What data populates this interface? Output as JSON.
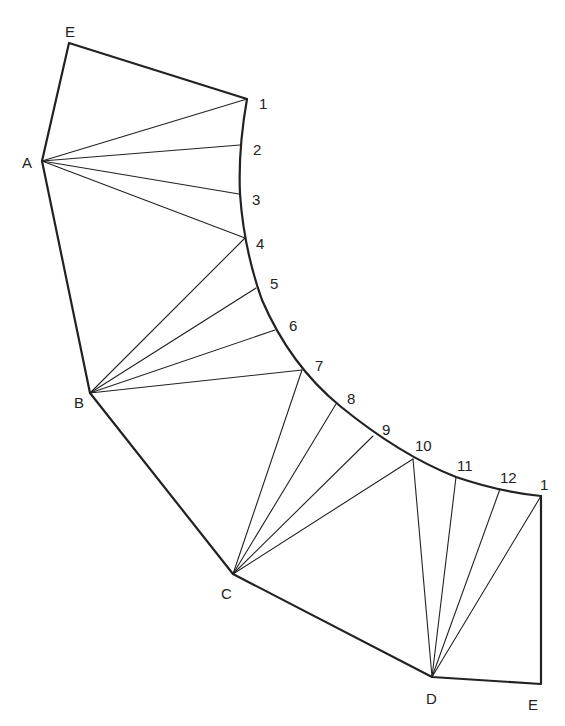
{
  "diagram": {
    "points": {
      "E_top": {
        "x": 69,
        "y": 43
      },
      "A": {
        "x": 42,
        "y": 161
      },
      "B": {
        "x": 90,
        "y": 393
      },
      "C": {
        "x": 233,
        "y": 574
      },
      "D": {
        "x": 432,
        "y": 677
      },
      "E_bottom": {
        "x": 541,
        "y": 684
      },
      "p1_top": {
        "x": 247,
        "y": 99
      },
      "p2": {
        "x": 240,
        "y": 145
      },
      "p3": {
        "x": 239,
        "y": 194
      },
      "p4": {
        "x": 245,
        "y": 238
      },
      "p5": {
        "x": 256,
        "y": 288
      },
      "p6": {
        "x": 275,
        "y": 330
      },
      "p7": {
        "x": 302,
        "y": 370
      },
      "p8": {
        "x": 336,
        "y": 404
      },
      "p9": {
        "x": 373,
        "y": 436
      },
      "p10": {
        "x": 413,
        "y": 459
      },
      "p11": {
        "x": 456,
        "y": 477
      },
      "p12": {
        "x": 500,
        "y": 489
      },
      "p1_bottom": {
        "x": 541,
        "y": 496
      }
    },
    "labels": [
      {
        "text": "E",
        "x": 65,
        "y": 24
      },
      {
        "text": "1",
        "x": 259,
        "y": 96
      },
      {
        "text": "A",
        "x": 22,
        "y": 155
      },
      {
        "text": "2",
        "x": 253,
        "y": 142
      },
      {
        "text": "3",
        "x": 252,
        "y": 192
      },
      {
        "text": "4",
        "x": 256,
        "y": 236
      },
      {
        "text": "5",
        "x": 270,
        "y": 276
      },
      {
        "text": "6",
        "x": 289,
        "y": 318
      },
      {
        "text": "7",
        "x": 315,
        "y": 358
      },
      {
        "text": "B",
        "x": 74,
        "y": 395
      },
      {
        "text": "8",
        "x": 347,
        "y": 391
      },
      {
        "text": "9",
        "x": 382,
        "y": 422
      },
      {
        "text": "10",
        "x": 415,
        "y": 438
      },
      {
        "text": "11",
        "x": 457,
        "y": 458
      },
      {
        "text": "12",
        "x": 500,
        "y": 470
      },
      {
        "text": "1",
        "x": 540,
        "y": 477
      },
      {
        "text": "C",
        "x": 221,
        "y": 586
      },
      {
        "text": "D",
        "x": 426,
        "y": 691
      },
      {
        "text": "E",
        "x": 528,
        "y": 697
      }
    ],
    "stroke_color": "#222222"
  }
}
